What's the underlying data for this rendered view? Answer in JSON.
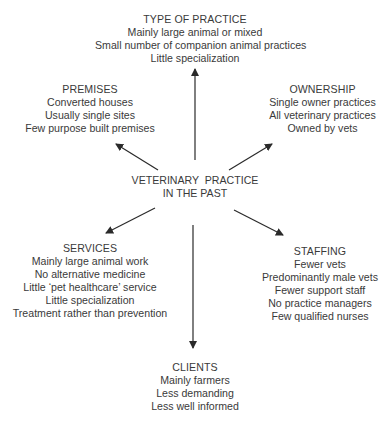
{
  "center": {
    "line1": "VETERINARY  PRACTICE",
    "line2": "IN THE PAST"
  },
  "nodes": {
    "type_of_practice": {
      "title": "TYPE OF PRACTICE",
      "items": [
        "Mainly large animal or mixed",
        "Small number of companion animal practices",
        "Little specialization"
      ]
    },
    "premises": {
      "title": "PREMISES",
      "items": [
        "Converted houses",
        "Usually single sites",
        "Few purpose built premises"
      ]
    },
    "ownership": {
      "title": "OWNERSHIP",
      "items": [
        "Single owner practices",
        "All veterinary practices",
        "Owned by vets"
      ]
    },
    "services": {
      "title": "SERVICES",
      "items": [
        "Mainly large animal work",
        "No alternative medicine",
        "Little ‘pet healthcare’ service",
        "Little specialization",
        "Treatment rather than prevention"
      ]
    },
    "staffing": {
      "title": "STAFFING",
      "items": [
        "Fewer vets",
        "Predominantly male vets",
        "Fewer support staff",
        "No practice managers",
        "Few qualified nurses"
      ]
    },
    "clients": {
      "title": "CLIENTS",
      "items": [
        "Mainly farmers",
        "Less demanding",
        "Less well informed"
      ]
    }
  },
  "colors": {
    "text": "#3a3a3a",
    "arrow": "#2a2a2a",
    "background": "#ffffff"
  }
}
